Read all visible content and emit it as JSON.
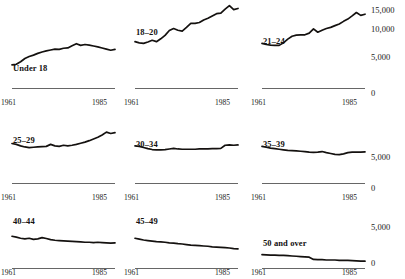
{
  "figure": {
    "cropped_header_text": "Number of persons arrested, by age group, per population",
    "x_axis": {
      "start_label": "1961",
      "end_label": "1985",
      "start": 1961,
      "end": 1985
    },
    "y_axis": {
      "labels": [
        "15,000",
        "10,000",
        "5,000",
        "0"
      ],
      "values": [
        15000,
        10000,
        5000,
        0
      ],
      "min": 0,
      "max": 16000
    },
    "colors": {
      "line": "#14110f",
      "axis": "#555555",
      "text": "#1a1a1a"
    }
  },
  "chart_data": {
    "type": "line",
    "title": "Number of persons arrested, by age group, per population",
    "xlabel": "",
    "ylabel": "",
    "xlim": [
      1961,
      1985
    ],
    "ylim": [
      0,
      16000
    ],
    "grid": false,
    "legend": "none",
    "layout": {
      "rows": 3,
      "cols": 3,
      "shared_y_axis": true,
      "y_axis_position": "right-column"
    },
    "x": [
      1961,
      1962,
      1963,
      1964,
      1965,
      1966,
      1967,
      1968,
      1969,
      1970,
      1971,
      1972,
      1973,
      1974,
      1975,
      1976,
      1977,
      1978,
      1979,
      1980,
      1981,
      1982,
      1983,
      1984,
      1985
    ],
    "series": [
      {
        "name": "Under 18",
        "panel": {
          "row": 0,
          "col": 0
        },
        "values": [
          4050,
          4150,
          4600,
          5150,
          5500,
          5750,
          6050,
          6300,
          6500,
          6650,
          6800,
          6750,
          6950,
          7000,
          7400,
          7750,
          7450,
          7600,
          7500,
          7350,
          7200,
          7000,
          6800,
          6600,
          6750
        ]
      },
      {
        "name": "18–20",
        "panel": {
          "row": 0,
          "col": 1
        },
        "values": [
          8100,
          7900,
          7800,
          8050,
          8350,
          8100,
          8600,
          9200,
          10050,
          10400,
          10100,
          9950,
          10600,
          11300,
          11300,
          11450,
          11900,
          12200,
          12600,
          13000,
          13100,
          13800,
          14400,
          13700,
          13900
        ]
      },
      {
        "name": "21–24",
        "panel": {
          "row": 0,
          "col": 2
        },
        "values": [
          7800,
          7600,
          7500,
          7450,
          7450,
          7900,
          8550,
          9050,
          9250,
          9300,
          9300,
          9600,
          10350,
          9750,
          10100,
          10400,
          10600,
          10900,
          11200,
          11650,
          12050,
          12600,
          13200,
          12700,
          12900
        ]
      },
      {
        "name": "25–29",
        "panel": {
          "row": 1,
          "col": 0
        },
        "values": [
          6900,
          6750,
          6500,
          6300,
          6200,
          6250,
          6300,
          6350,
          6400,
          6750,
          6500,
          6400,
          6600,
          6500,
          6600,
          6750,
          6950,
          7150,
          7400,
          7700,
          8000,
          8400,
          8900,
          8650,
          8800
        ]
      },
      {
        "name": "30–34",
        "panel": {
          "row": 1,
          "col": 1
        },
        "values": [
          6500,
          6400,
          6200,
          6000,
          5850,
          5800,
          5800,
          5850,
          5950,
          6050,
          5950,
          5900,
          5900,
          5900,
          5900,
          5950,
          5950,
          5950,
          6000,
          6000,
          6050,
          6600,
          6650,
          6600,
          6650
        ]
      },
      {
        "name": "35–39",
        "panel": {
          "row": 1,
          "col": 2
        },
        "values": [
          6400,
          6250,
          6100,
          6000,
          5900,
          5800,
          5700,
          5650,
          5600,
          5550,
          5500,
          5400,
          5350,
          5400,
          5500,
          5300,
          5150,
          5000,
          4950,
          5100,
          5300,
          5400,
          5400,
          5400,
          5450
        ]
      },
      {
        "name": "40–44",
        "panel": {
          "row": 2,
          "col": 0
        },
        "values": [
          5550,
          5400,
          5200,
          5100,
          5200,
          5000,
          5100,
          5300,
          5150,
          4950,
          4850,
          4800,
          4750,
          4700,
          4650,
          4600,
          4550,
          4500,
          4500,
          4450,
          4500,
          4450,
          4400,
          4350,
          4400
        ]
      },
      {
        "name": "45–49",
        "panel": {
          "row": 2,
          "col": 1
        },
        "values": [
          5200,
          5050,
          4900,
          4800,
          4700,
          4600,
          4550,
          4500,
          4400,
          4350,
          4250,
          4200,
          4100,
          4000,
          3950,
          3900,
          3850,
          3800,
          3700,
          3650,
          3600,
          3550,
          3500,
          3400,
          3350
        ]
      },
      {
        "name": "50 and over",
        "panel": {
          "row": 2,
          "col": 2
        },
        "values": [
          2350,
          2300,
          2250,
          2250,
          2200,
          2200,
          2150,
          2100,
          2050,
          2000,
          1950,
          1900,
          1500,
          1450,
          1450,
          1400,
          1400,
          1400,
          1350,
          1350,
          1350,
          1300,
          1250,
          1200,
          1200
        ]
      }
    ]
  }
}
